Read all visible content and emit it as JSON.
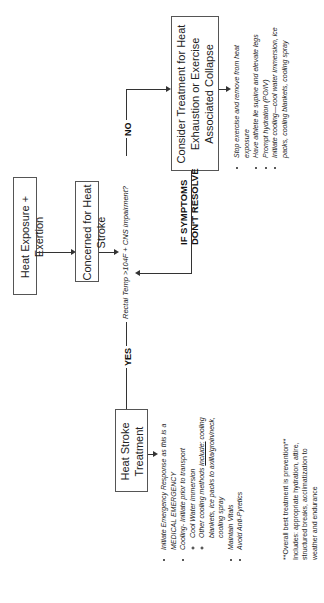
{
  "diagram": {
    "nodes": {
      "start": "Heat Exposure + Exertion",
      "concern": "Concerned for Heat Stroke",
      "question": "Rectal Temp >104F + CNS impairment?",
      "heat_stroke": "Heat Stroke Treatment",
      "exhaustion": "Consider Treatment for Heat Exhaustion or Exercise Associated Collapse"
    },
    "edges": {
      "yes": "YES",
      "no": "NO",
      "if_symptoms_line1": "IF SYMPTOMS",
      "if_symptoms_line2": "DON'T RESOLVE"
    },
    "heat_stroke_steps": {
      "item1": "Initiate Emergency Response as this is a MEDICAL EMERGENCY",
      "item2": "Cooling- Initiate prior to transport",
      "item2_sub1": "Cool Water Immersion",
      "item2_sub2_prefix": "Other cooling methods ",
      "item2_sub2_underline": "include:",
      "item2_sub2_rest": " cooling blankets, ice packs to axilla/groin/neck, cooling spray",
      "item3": "Maintain Vitals",
      "item4": "Avoid Anti-Pyretics"
    },
    "exhaustion_steps": [
      "Stop exercise and remove from heat exposure",
      "Have athlete lie supine and elevate legs",
      "Prompt hydration (PO/IV)",
      "Initiate cooling—cool water immersion, ice packs, cooling blankets, cooling spray"
    ],
    "prevention_note": {
      "title": "**Overall best treatment is prevention**",
      "body": "Includes: appropriate hydration, attire, structured breaks, acclimatization to weather and endurance"
    }
  }
}
